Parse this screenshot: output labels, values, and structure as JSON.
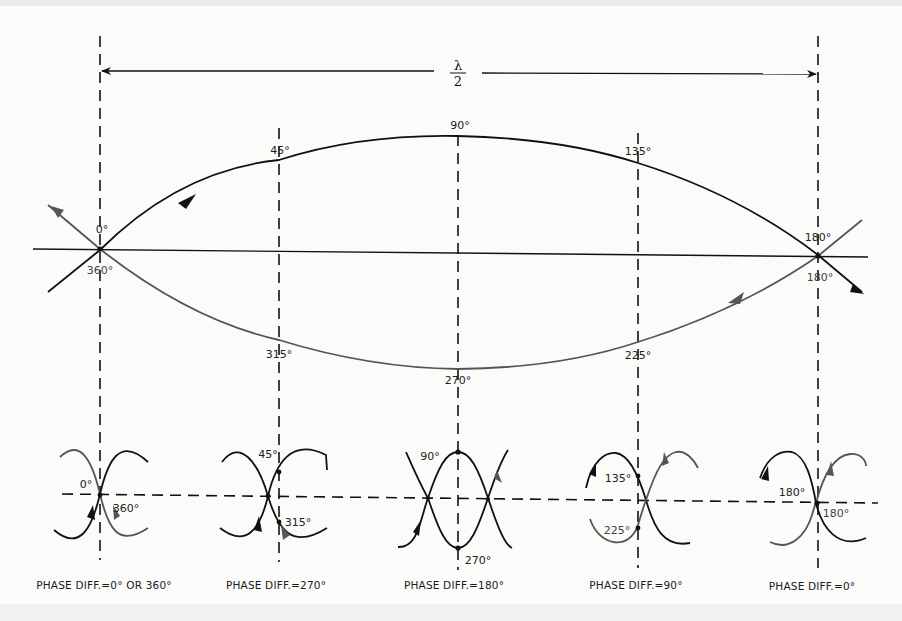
{
  "diagram": {
    "colors": {
      "black_curve": "#111111",
      "gray_curve": "#555555",
      "background": "#fbfbfa"
    },
    "top": {
      "span_label_numerator": "λ",
      "span_label_denominator": "2",
      "upper_arc_labels": {
        "start": "0°",
        "q1": "45°",
        "mid": "90°",
        "q3": "135°",
        "end": "180°"
      },
      "lower_arc_labels": {
        "start": "360°",
        "q1": "315°",
        "mid": "270°",
        "q3": "225°",
        "end": "180°"
      }
    },
    "panels": [
      {
        "upper_label": "0°",
        "lower_label": "360°",
        "caption": "PHASE DIFF.=0° OR 360°"
      },
      {
        "upper_label": "45°",
        "lower_label": "315°",
        "caption": "PHASE DIFF.=270°"
      },
      {
        "upper_label": "90°",
        "lower_label": "270°",
        "caption": "PHASE DIFF.=180°"
      },
      {
        "upper_label": "135°",
        "lower_label": "225°",
        "caption": "PHASE DIFF.=90°"
      },
      {
        "upper_label": "180°",
        "lower_label": "180°",
        "caption": "PHASE DIFF.=0°"
      }
    ]
  }
}
